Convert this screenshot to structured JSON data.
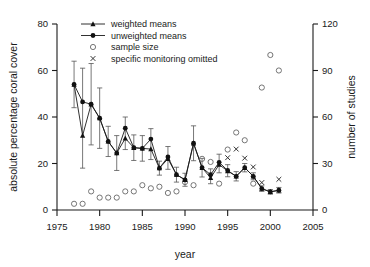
{
  "chart_data": {
    "type": "line",
    "title": "",
    "xlabel": "year",
    "ylabel": "absolute percentage coral cover",
    "ylabel_right": "number of studies",
    "xlim": [
      1975,
      2005
    ],
    "ylim": [
      0,
      80
    ],
    "ylim_right": [
      0,
      120
    ],
    "xticks": [
      "1975",
      "1980",
      "1985",
      "1990",
      "1995",
      "2000",
      "2005"
    ],
    "xtick_values": [
      1975,
      1980,
      1985,
      1990,
      1995,
      2000,
      2005
    ],
    "yticks": [
      "0",
      "20",
      "40",
      "60",
      "80"
    ],
    "ytick_values": [
      0,
      20,
      40,
      60,
      80
    ],
    "yticks_right": [
      "0",
      "30",
      "60",
      "90",
      "120"
    ],
    "ytick_right_values": [
      0,
      30,
      60,
      90,
      120
    ],
    "grid": false,
    "legend_position": "top-center",
    "x": [
      1977,
      1978,
      1979,
      1980,
      1981,
      1982,
      1983,
      1984,
      1985,
      1986,
      1987,
      1988,
      1989,
      1990,
      1991,
      1992,
      1993,
      1994,
      1995,
      1996,
      1997,
      1998,
      1999,
      2000,
      2001
    ],
    "series": [
      {
        "name": "weighted means",
        "marker": "triangle",
        "values": [
          54.0,
          32.0,
          45.5,
          39.5,
          29.5,
          24.5,
          30.8,
          26.8,
          26.5,
          26.2,
          18.0,
          22.0,
          15.2,
          13.0,
          28.7,
          18.2,
          13.8,
          19.5,
          16.8,
          14.5,
          18.2,
          14.5,
          9.2,
          7.8,
          8.5
        ],
        "errors": [
          10.0,
          14.0,
          17.5,
          13.0,
          6.5,
          7.5,
          4.8,
          5.5,
          5.5,
          4.5,
          3.0,
          4.5,
          3.2,
          2.8,
          7.5,
          4.0,
          2.5,
          3.5,
          2.5,
          2.0,
          1.8,
          1.5,
          1.2,
          1.0,
          1.2
        ]
      },
      {
        "name": "unweighted means",
        "marker": "circle",
        "values": [
          54.0,
          46.5,
          45.5,
          39.5,
          29.5,
          24.5,
          35.2,
          26.8,
          26.5,
          30.5,
          18.0,
          22.8,
          15.2,
          13.0,
          28.7,
          18.2,
          15.2,
          20.5,
          17.0,
          14.5,
          18.2,
          14.5,
          9.2,
          7.8,
          8.5
        ],
        "errors": [
          10.0,
          14.5,
          17.5,
          13.0,
          6.5,
          7.5,
          4.8,
          5.5,
          5.5,
          4.5,
          3.0,
          4.5,
          3.2,
          2.8,
          7.5,
          4.0,
          2.5,
          3.5,
          2.5,
          2.0,
          1.8,
          1.5,
          1.2,
          1.0,
          1.2
        ]
      }
    ],
    "sample_size": {
      "name": "sample size",
      "marker": "open-circle",
      "axis": "right",
      "x": [
        1977,
        1978,
        1979,
        1980,
        1981,
        1982,
        1983,
        1984,
        1985,
        1986,
        1987,
        1988,
        1989,
        1990,
        1991,
        1992,
        1993,
        1994,
        1995,
        1996,
        1997,
        1998,
        1999,
        2000,
        2001
      ],
      "values": [
        4,
        4,
        12,
        8,
        8,
        8,
        12,
        12,
        16,
        14,
        15,
        11,
        12,
        18,
        16,
        33,
        31,
        17,
        39,
        50,
        45,
        17,
        79,
        100,
        90,
        84
      ]
    },
    "omitted": {
      "name": "specific monitoring omitted",
      "marker": "x",
      "axis": "left",
      "x": [
        1995,
        1996,
        1997,
        1998,
        1999,
        2001
      ],
      "values": [
        22.5,
        26.2,
        22.3,
        18.5,
        11.8,
        13.2
      ]
    }
  },
  "legend": {
    "items": [
      {
        "label": "weighted means",
        "marker": "triangle-line"
      },
      {
        "label": "unweighted means",
        "marker": "circle-line"
      },
      {
        "label": "sample size",
        "marker": "open-circle"
      },
      {
        "label": "specific monitoring omitted",
        "marker": "x-mark"
      }
    ]
  },
  "colors": {
    "foreground": "#1a1a1a",
    "marker_fill": "#111111",
    "error_bar": "#555555",
    "open_marker": "#666666",
    "background": "#ffffff"
  }
}
